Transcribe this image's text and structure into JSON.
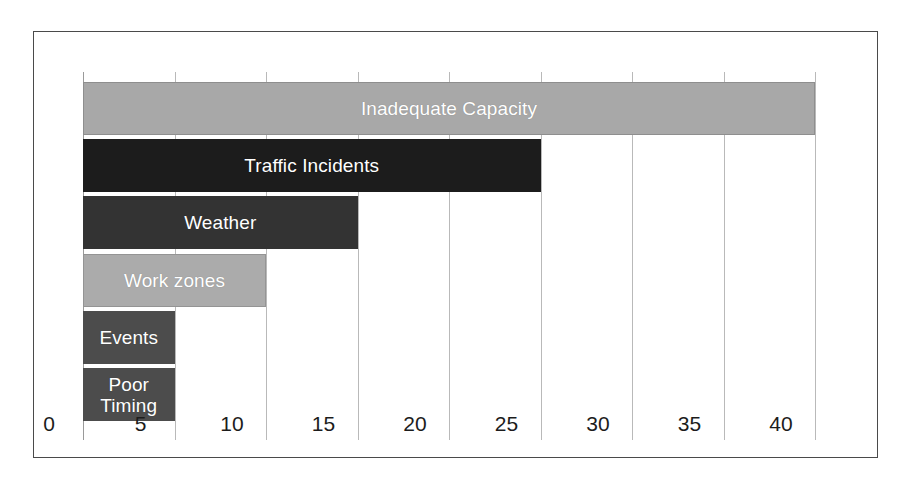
{
  "figure": {
    "background_color": "#ffffff",
    "frame_color": "#4a4a4a",
    "gridline_color": "#b9b9b9",
    "label_text_color": "#ffffff",
    "tick_text_color": "#1c1c1c"
  },
  "chart_data": {
    "type": "bar",
    "orientation": "horizontal",
    "title": "",
    "subtitle": "",
    "xlabel": "",
    "ylabel": "",
    "xlim": [
      0,
      40
    ],
    "ylim": null,
    "grid": true,
    "legend": false,
    "legend_position": "none",
    "categories": [
      "Inadequate Capacity",
      "Traffic Incidents",
      "Weather",
      "Work zones",
      "Events",
      "Poor Timing"
    ],
    "values": [
      40,
      25,
      15,
      10,
      5,
      5
    ],
    "bar_colors": [
      "#a8a8a8",
      "#1c1c1c",
      "#333333",
      "#ababab",
      "#4c4c4c",
      "#4c4c4c"
    ],
    "bar_edge_colors": [
      "#8e8e8e",
      "#1c1c1c",
      "#333333",
      "#949494",
      "#4c4c4c",
      "#4c4c4c"
    ],
    "xticks": [
      0,
      5,
      10,
      15,
      20,
      25,
      30,
      35,
      40
    ],
    "xtick_labels": [
      "0",
      "5",
      "10",
      "15",
      "20",
      "25",
      "30",
      "35",
      "40"
    ],
    "yticks": [],
    "ytick_labels": [],
    "annotations": [],
    "data_labels_inside_bars": true
  }
}
